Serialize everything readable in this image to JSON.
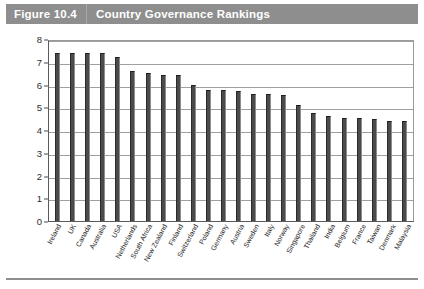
{
  "figure": {
    "number_label": "Figure 10.4",
    "title": "Country Governance Rankings"
  },
  "colors": {
    "title_bar": "#8e8e8e",
    "title_text": "#ffffff",
    "bar_fill": "#4b4b4b",
    "gridline": "#a0a0a0",
    "axis": "#5a5a5a"
  },
  "chart_data": {
    "type": "bar",
    "title": "Country Governance Rankings",
    "xlabel": "",
    "ylabel": "",
    "ylim": [
      0,
      8
    ],
    "ytick_values": [
      0,
      1,
      2,
      3,
      4,
      5,
      6,
      7,
      8
    ],
    "ytick_labels": [
      "0",
      "1",
      "2",
      "3",
      "4",
      "5",
      "6",
      "7",
      "8"
    ],
    "grid": true,
    "legend": false,
    "categories": [
      "Ireland",
      "UK",
      "Canada",
      "Australia",
      "USA",
      "Netherlands",
      "South Africa",
      "New Zealand",
      "Finland",
      "Switzerland",
      "Poland",
      "Germany",
      "Austria",
      "Sweden",
      "Italy",
      "Norway",
      "Singapore",
      "Thailand",
      "India",
      "Belgium",
      "France",
      "Taiwan",
      "Denmark",
      "Malaysia"
    ],
    "values": [
      7.4,
      7.4,
      7.4,
      7.4,
      7.2,
      6.6,
      6.5,
      6.4,
      6.4,
      6.0,
      5.75,
      5.75,
      5.7,
      5.6,
      5.6,
      5.55,
      5.1,
      4.75,
      4.6,
      4.55,
      4.55,
      4.5,
      4.4,
      4.4
    ]
  }
}
